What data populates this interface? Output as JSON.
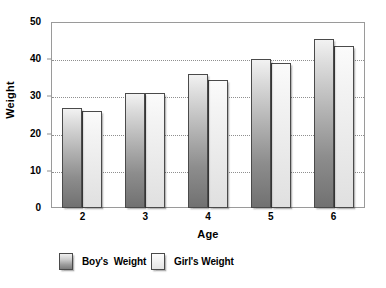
{
  "chart_data": {
    "type": "bar",
    "title": "",
    "xlabel": "Age",
    "ylabel": "Weight",
    "categories": [
      "2",
      "3",
      "4",
      "5",
      "6"
    ],
    "series": [
      {
        "name": "Boy's  Weight",
        "values": [
          27,
          31,
          36,
          40,
          45.5
        ],
        "color": "#8d8d8d"
      },
      {
        "name": "Girl's Weight",
        "values": [
          26,
          31,
          34.5,
          39,
          43.5
        ],
        "color": "#eaeaea"
      }
    ],
    "ylim": [
      0,
      50
    ],
    "yticks": [
      0,
      10,
      20,
      30,
      40,
      50
    ],
    "ytick_labels": [
      "0",
      "10",
      "20",
      "30",
      "40",
      "50"
    ],
    "gridlines": [
      10,
      20,
      30,
      40
    ],
    "grid": true,
    "legend_position": "bottom"
  },
  "legend": {
    "items": [
      {
        "label": "Boy's  Weight",
        "swatch": "boy-weight-swatch"
      },
      {
        "label": "Girl's Weight",
        "swatch": "girl-weight-swatch"
      }
    ]
  },
  "axes": {
    "y_title": "Weight",
    "x_title": "Age"
  }
}
